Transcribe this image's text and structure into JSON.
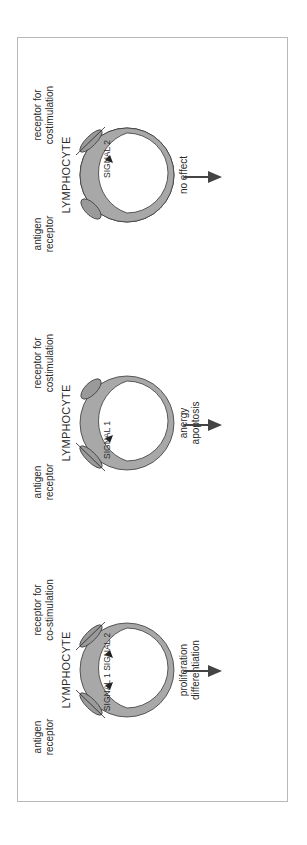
{
  "figure": {
    "orientation": "rotated 90deg counter-clockwise",
    "colors": {
      "ring_fill": "#a8a8a8",
      "ring_stroke": "#3a3a3a",
      "receptor_fill": "#9a9a9a",
      "text": "#2a2a2a",
      "border": "#b8b8b8",
      "arrow": "#444444"
    },
    "panels": [
      {
        "title": "LYMPHOCYTE",
        "antigen_label_1": "antigen",
        "antigen_label_2": "receptor",
        "costim_label_1": "receptor for",
        "costim_label_2": "costimulation",
        "signals": "SIGNAL 2",
        "outcome_1": "no effect",
        "outcome_2": ""
      },
      {
        "title": "LYMPHOCYTE",
        "antigen_label_1": "antigen",
        "antigen_label_2": "receptor",
        "costim_label_1": "receptor for",
        "costim_label_2": "costimulation",
        "signals": "SIGNAL 1",
        "outcome_1": "anergy",
        "outcome_2": "apoptosis"
      },
      {
        "title": "LYMPHOCYTE",
        "antigen_label_1": "antigen",
        "antigen_label_2": "receptor",
        "costim_label_1": "receptor for",
        "costim_label_2": "co-stimulation",
        "signals": "SIGNAL 1  SIGNAL 2",
        "outcome_1": "proliferation",
        "outcome_2": "differentiation"
      }
    ]
  }
}
